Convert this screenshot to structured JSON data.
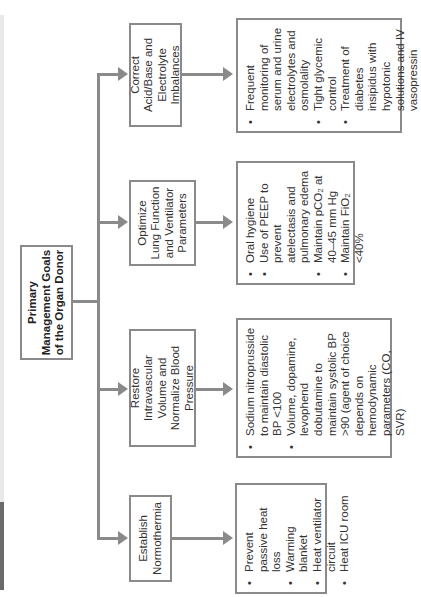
{
  "diagram": {
    "title": "Primary Management Goals of the Organ Donor",
    "root": {
      "line1": "Primary",
      "line2": "Management Goals",
      "line3": "of the Organ Donor"
    },
    "goals": [
      {
        "label": "Establish Normothermia",
        "items": [
          "Prevent passive heat loss",
          "Warming blanket",
          "Heat ventilator circuit",
          "Heat ICU room"
        ]
      },
      {
        "label": "Restore Intravascular Volume and Normalize Blood Pressure",
        "items": [
          "Sodium nitroprusside to maintain diastolic BP <100",
          "Volume, dopamine, levophend dobutamine to maintain systolic BP >90 (agent of choice depends on hemodynamic parameters (CO, SVR)"
        ]
      },
      {
        "label": "Optimize Lung Function and Ventilator Parameters",
        "items": [
          "Oral hygiene",
          "Use of PEEP to prevent atelectasis and pulmonary edema",
          "Maintain pCO₂ at 40–45 mm Hg",
          "Maintain FiO₂ <40%"
        ]
      },
      {
        "label": "Correct Acid/Base and Electrolyte Imbalances",
        "items": [
          "Frequent monitoring of serum and urine electrolytes and osmolality",
          "Tight glycemic control",
          "Treatment of diabetes insipidus with hypotonic solutions and IV vasopressin"
        ]
      }
    ],
    "colors": {
      "line": "#8a8a8a",
      "border": "#8a8a8a",
      "text": "#333333"
    }
  }
}
